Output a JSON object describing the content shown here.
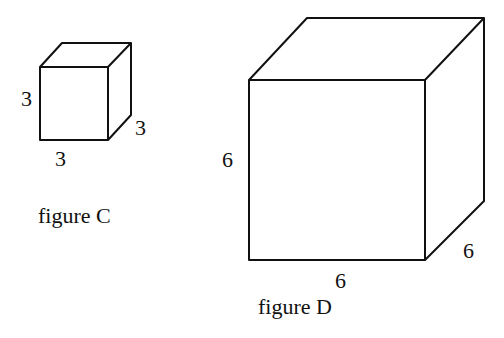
{
  "figures": [
    {
      "name": "figure C",
      "caption": "figure C",
      "shape": "cube",
      "dimensions": {
        "height": "3",
        "width": "3",
        "depth": "3"
      }
    },
    {
      "name": "figure D",
      "caption": "figure D",
      "shape": "cube",
      "dimensions": {
        "height": "6",
        "width": "6",
        "depth": "6"
      }
    }
  ],
  "colors": {
    "stroke": "#111111",
    "background": "#ffffff"
  }
}
